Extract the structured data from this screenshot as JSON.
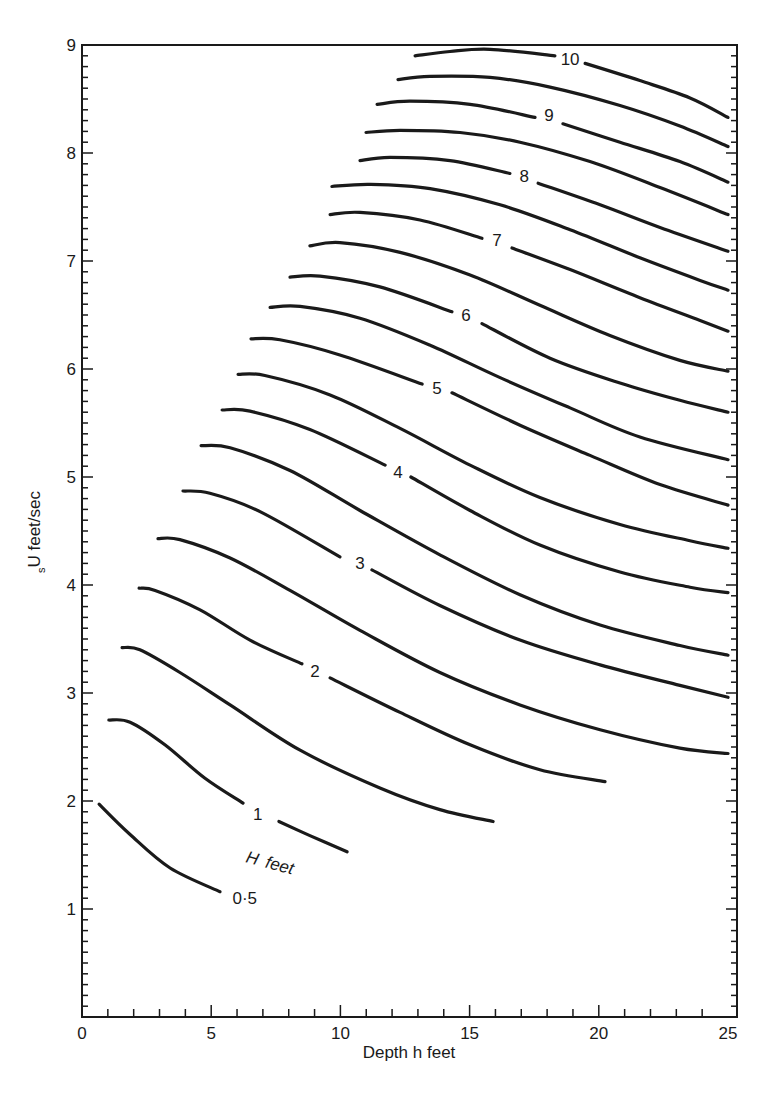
{
  "chart_data": {
    "type": "line",
    "title": "",
    "xlabel": "Depth h feet",
    "ylabel_sub": "s",
    "ylabel_main": "U feet/sec",
    "ylabel": "sU feet/sec",
    "xlim": [
      0,
      25
    ],
    "ylim": [
      0,
      9
    ],
    "x_ticks": [
      0,
      5,
      10,
      15,
      20,
      25
    ],
    "y_ticks": [
      1,
      2,
      3,
      4,
      5,
      6,
      7,
      8,
      9
    ],
    "x_minor_step": 1,
    "y_minor_step": 0.1,
    "grid": false,
    "legend": null,
    "annotations": [
      {
        "text": "H feet",
        "h": 7.0,
        "U": 1.45,
        "rotate": 15
      }
    ],
    "series_parameter": "H feet",
    "series": [
      {
        "name": "0.5",
        "label": "0·5",
        "label_at": [
          6.3,
          1.1
        ],
        "segments": [
          [
            [
              0.66,
              1.97
            ],
            [
              1.86,
              1.69
            ],
            [
              3.41,
              1.38
            ],
            [
              5.34,
              1.16
            ]
          ]
        ]
      },
      {
        "name": "1",
        "label": "1",
        "label_at": [
          6.8,
          1.88
        ],
        "segments": [
          [
            [
              1.04,
              2.75
            ],
            [
              1.86,
              2.73
            ],
            [
              3.21,
              2.52
            ],
            [
              4.76,
              2.21
            ],
            [
              6.23,
              1.98
            ]
          ],
          [
            [
              7.62,
              1.81
            ],
            [
              8.82,
              1.68
            ],
            [
              10.26,
              1.53
            ]
          ]
        ]
      },
      {
        "name": "1.5",
        "label": "",
        "segments": [
          [
            [
              1.55,
              3.42
            ],
            [
              2.24,
              3.4
            ],
            [
              3.79,
              3.19
            ],
            [
              5.73,
              2.89
            ],
            [
              8.44,
              2.47
            ],
            [
              11.53,
              2.12
            ],
            [
              13.85,
              1.92
            ],
            [
              15.91,
              1.81
            ]
          ]
        ]
      },
      {
        "name": "2",
        "label": "2",
        "label_at": [
          9.02,
          3.2
        ],
        "segments": [
          [
            [
              2.21,
              3.97
            ],
            [
              2.83,
              3.95
            ],
            [
              4.57,
              3.77
            ],
            [
              6.5,
              3.49
            ],
            [
              8.51,
              3.27
            ]
          ],
          [
            [
              9.6,
              3.14
            ],
            [
              12.31,
              2.82
            ],
            [
              15.02,
              2.52
            ],
            [
              17.72,
              2.29
            ],
            [
              20.24,
              2.18
            ]
          ]
        ]
      },
      {
        "name": "2.5",
        "label": "",
        "segments": [
          [
            [
              2.94,
              4.43
            ],
            [
              3.79,
              4.42
            ],
            [
              5.73,
              4.25
            ],
            [
              8.05,
              3.95
            ],
            [
              10.76,
              3.58
            ],
            [
              13.85,
              3.19
            ],
            [
              16.95,
              2.89
            ],
            [
              20.05,
              2.66
            ],
            [
              23.14,
              2.49
            ],
            [
              25,
              2.44
            ]
          ]
        ]
      },
      {
        "name": "3",
        "label": "3",
        "label_at": [
          10.76,
          4.2
        ],
        "segments": [
          [
            [
              3.91,
              4.87
            ],
            [
              4.95,
              4.85
            ],
            [
              6.89,
              4.68
            ],
            [
              9.98,
              4.26
            ]
          ],
          [
            [
              11.22,
              4.14
            ],
            [
              13.85,
              3.81
            ],
            [
              16.95,
              3.49
            ],
            [
              20.05,
              3.26
            ],
            [
              23.14,
              3.07
            ],
            [
              25,
              2.96
            ]
          ]
        ]
      },
      {
        "name": "3.5",
        "label": "",
        "segments": [
          [
            [
              4.61,
              5.29
            ],
            [
              5.73,
              5.27
            ],
            [
              8.05,
              5.06
            ],
            [
              10.76,
              4.69
            ],
            [
              13.85,
              4.28
            ],
            [
              16.95,
              3.91
            ],
            [
              20.05,
              3.63
            ],
            [
              23.14,
              3.44
            ],
            [
              25,
              3.35
            ]
          ]
        ]
      },
      {
        "name": "4",
        "label": "4",
        "label_at": [
          12.23,
          5.05
        ],
        "segments": [
          [
            [
              5.42,
              5.62
            ],
            [
              6.5,
              5.61
            ],
            [
              8.82,
              5.44
            ],
            [
              11.73,
              5.11
            ]
          ],
          [
            [
              12.73,
              5.0
            ],
            [
              15.02,
              4.69
            ],
            [
              17.72,
              4.37
            ],
            [
              20.82,
              4.12
            ],
            [
              23.53,
              3.98
            ],
            [
              25,
              3.93
            ]
          ]
        ]
      },
      {
        "name": "4.5",
        "label": "",
        "segments": [
          [
            [
              6.04,
              5.95
            ],
            [
              7.08,
              5.94
            ],
            [
              9.6,
              5.76
            ],
            [
              12.31,
              5.45
            ],
            [
              15.02,
              5.11
            ],
            [
              17.72,
              4.81
            ],
            [
              20.82,
              4.56
            ],
            [
              23.53,
              4.41
            ],
            [
              25,
              4.34
            ]
          ]
        ]
      },
      {
        "name": "5",
        "label": "5",
        "label_at": [
          13.74,
          5.82
        ],
        "segments": [
          [
            [
              6.54,
              6.28
            ],
            [
              7.66,
              6.27
            ],
            [
              9.98,
              6.13
            ],
            [
              13.16,
              5.86
            ]
          ],
          [
            [
              14.32,
              5.78
            ],
            [
              16.95,
              5.48
            ],
            [
              19.66,
              5.2
            ],
            [
              22.37,
              4.93
            ],
            [
              25,
              4.74
            ]
          ]
        ]
      },
      {
        "name": "5.5",
        "label": "",
        "segments": [
          [
            [
              7.28,
              6.57
            ],
            [
              8.44,
              6.58
            ],
            [
              10.76,
              6.47
            ],
            [
              13.47,
              6.22
            ],
            [
              16.18,
              5.92
            ],
            [
              18.89,
              5.64
            ],
            [
              21.59,
              5.37
            ],
            [
              25,
              5.16
            ]
          ]
        ]
      },
      {
        "name": "6",
        "label": "6",
        "label_at": [
          14.86,
          6.5
        ],
        "segments": [
          [
            [
              8.05,
              6.85
            ],
            [
              9.21,
              6.86
            ],
            [
              11.53,
              6.76
            ],
            [
              14.32,
              6.53
            ]
          ],
          [
            [
              15.48,
              6.42
            ],
            [
              18.11,
              6.1
            ],
            [
              20.82,
              5.87
            ],
            [
              23.14,
              5.71
            ],
            [
              25,
              5.6
            ]
          ]
        ]
      },
      {
        "name": "6.5",
        "label": "",
        "segments": [
          [
            [
              8.82,
              7.14
            ],
            [
              9.98,
              7.17
            ],
            [
              12.31,
              7.08
            ],
            [
              15.02,
              6.87
            ],
            [
              17.72,
              6.59
            ],
            [
              20.43,
              6.31
            ],
            [
              23.14,
              6.08
            ],
            [
              25,
              5.98
            ]
          ]
        ]
      },
      {
        "name": "7",
        "label": "7",
        "label_at": [
          16.06,
          7.19
        ],
        "segments": [
          [
            [
              9.6,
              7.43
            ],
            [
              10.76,
              7.45
            ],
            [
              13.08,
              7.38
            ],
            [
              15.48,
              7.21
            ]
          ],
          [
            [
              16.64,
              7.12
            ],
            [
              18.89,
              6.92
            ],
            [
              21.59,
              6.66
            ],
            [
              23.92,
              6.45
            ],
            [
              25,
              6.35
            ]
          ]
        ]
      },
      {
        "name": "7.5",
        "label": "",
        "segments": [
          [
            [
              9.67,
              7.69
            ],
            [
              11.15,
              7.71
            ],
            [
              13.47,
              7.67
            ],
            [
              16.18,
              7.52
            ],
            [
              18.89,
              7.29
            ],
            [
              21.59,
              7.03
            ],
            [
              23.92,
              6.82
            ],
            [
              25,
              6.73
            ]
          ]
        ]
      },
      {
        "name": "8",
        "label": "8",
        "label_at": [
          17.11,
          7.79
        ],
        "segments": [
          [
            [
              10.76,
              7.93
            ],
            [
              11.92,
              7.96
            ],
            [
              14.24,
              7.93
            ],
            [
              16.56,
              7.81
            ]
          ],
          [
            [
              17.65,
              7.72
            ],
            [
              20.05,
              7.52
            ],
            [
              22.37,
              7.31
            ],
            [
              25,
              7.09
            ]
          ]
        ]
      },
      {
        "name": "8.5",
        "label": "",
        "segments": [
          [
            [
              10.99,
              8.19
            ],
            [
              12.31,
              8.21
            ],
            [
              14.63,
              8.19
            ],
            [
              16.95,
              8.1
            ],
            [
              19.66,
              7.92
            ],
            [
              22.37,
              7.68
            ],
            [
              25,
              7.43
            ]
          ]
        ]
      },
      {
        "name": "9",
        "label": "9",
        "label_at": [
          18.07,
          8.35
        ],
        "segments": [
          [
            [
              11.42,
              8.45
            ],
            [
              12.69,
              8.48
            ],
            [
              15.02,
              8.45
            ],
            [
              17.53,
              8.33
            ]
          ],
          [
            [
              18.61,
              8.27
            ],
            [
              20.82,
              8.1
            ],
            [
              23.14,
              7.92
            ],
            [
              25,
              7.73
            ]
          ]
        ]
      },
      {
        "name": "9.5",
        "label": "",
        "segments": [
          [
            [
              12.23,
              8.68
            ],
            [
              13.47,
              8.71
            ],
            [
              15.79,
              8.7
            ],
            [
              18.11,
              8.61
            ],
            [
              20.82,
              8.44
            ],
            [
              23.14,
              8.25
            ],
            [
              25,
              8.06
            ]
          ]
        ]
      },
      {
        "name": "10",
        "label": "10",
        "label_at": [
          18.89,
          8.87
        ],
        "segments": [
          [
            [
              12.89,
              8.9
            ],
            [
              14.24,
              8.94
            ],
            [
              15.79,
              8.96
            ],
            [
              18.3,
              8.9
            ]
          ],
          [
            [
              19.47,
              8.83
            ],
            [
              21.59,
              8.67
            ],
            [
              23.53,
              8.51
            ],
            [
              25,
              8.33
            ]
          ]
        ]
      }
    ]
  },
  "axes": {
    "x_title": "Depth h feet",
    "y_title_sub": "s",
    "y_title_main": "U feet/sec",
    "annotation": "H feet"
  },
  "style": {
    "ink": "#1a1a1a",
    "background": "#ffffff"
  }
}
